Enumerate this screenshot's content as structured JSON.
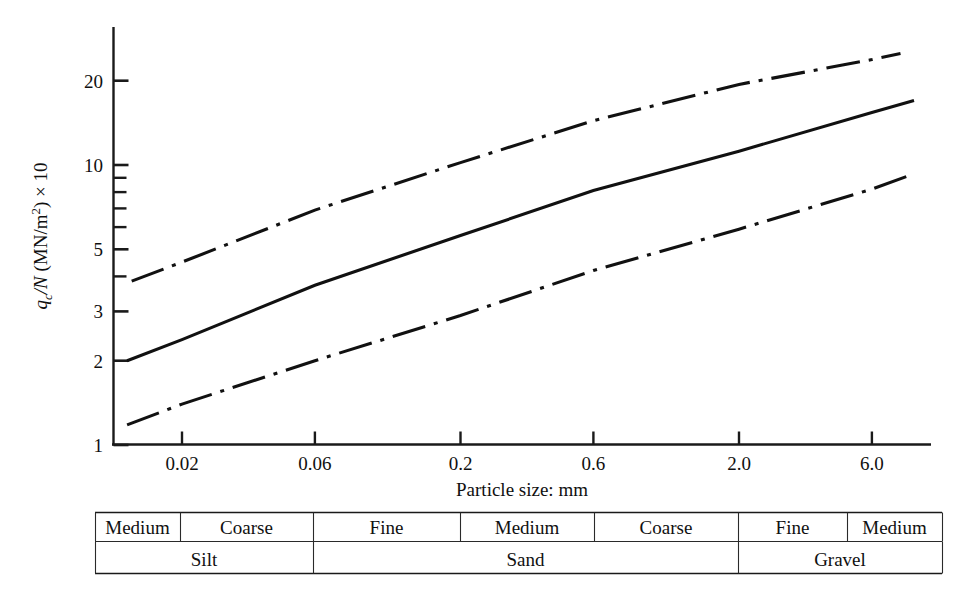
{
  "figure": {
    "background_color": "#ffffff",
    "ink_color": "#111111"
  },
  "axes": {
    "x_title": "Particle size: mm",
    "y_title_parts": {
      "q": "q",
      "sub_c": "c",
      "slash_n": "/N",
      "units": " (MN/m",
      "sup_2": "2",
      "tail": ") × 10"
    },
    "y_title_plain": "qc/N (MN/m2) × 10",
    "x_ticks": [
      "0.02",
      "0.06",
      "0.2",
      "0.6",
      "2.0",
      "6.0"
    ],
    "y_ticks_major": [
      "1",
      "2",
      "3",
      "5",
      "10",
      "20"
    ],
    "y_ticks_minor": [
      "4",
      "6",
      "7",
      "8",
      "9"
    ]
  },
  "chart_data": {
    "type": "line",
    "title": "",
    "xlabel": "Particle size: mm",
    "ylabel": "qc/N (MN/m2) × 10",
    "xscale": "log",
    "yscale": "log",
    "xlim": [
      0.0113,
      8.6
    ],
    "ylim": [
      1,
      27
    ],
    "xticks": [
      0.02,
      0.06,
      0.2,
      0.6,
      2.0,
      6.0
    ],
    "xticklabels": [
      "0.02",
      "0.06",
      "0.2",
      "0.6",
      "2.0",
      "6.0"
    ],
    "yticks": [
      1,
      2,
      3,
      4,
      5,
      6,
      7,
      8,
      9,
      10,
      20
    ],
    "yticklabels_shown": [
      "1",
      "2",
      "3",
      "5",
      "10",
      "20"
    ],
    "grid": false,
    "legend": null,
    "series": [
      {
        "name": "upper bound",
        "style": "dash-dot",
        "x": [
          0.0132,
          7.6
        ],
        "y": [
          3.85,
          25.0
        ],
        "points": [
          {
            "x": 0.0132,
            "y": 3.85
          },
          {
            "x": 0.02,
            "y": 4.5
          },
          {
            "x": 0.06,
            "y": 6.9
          },
          {
            "x": 0.2,
            "y": 10.2
          },
          {
            "x": 0.6,
            "y": 14.4
          },
          {
            "x": 2.0,
            "y": 19.4
          },
          {
            "x": 6.0,
            "y": 23.8
          },
          {
            "x": 7.6,
            "y": 25.0
          }
        ]
      },
      {
        "name": "mean",
        "style": "solid",
        "x": [
          0.0127,
          8.5
        ],
        "y": [
          2.0,
          17.0
        ],
        "points": [
          {
            "x": 0.0127,
            "y": 2.0
          },
          {
            "x": 0.02,
            "y": 2.38
          },
          {
            "x": 0.06,
            "y": 3.72
          },
          {
            "x": 0.2,
            "y": 5.6
          },
          {
            "x": 0.6,
            "y": 8.1
          },
          {
            "x": 2.0,
            "y": 11.2
          },
          {
            "x": 6.0,
            "y": 15.4
          },
          {
            "x": 8.5,
            "y": 17.0
          }
        ]
      },
      {
        "name": "lower bound",
        "style": "dash-dot",
        "x": [
          0.0127,
          8.5
        ],
        "y": [
          1.18,
          9.3
        ],
        "points": [
          {
            "x": 0.0127,
            "y": 1.18
          },
          {
            "x": 0.02,
            "y": 1.4
          },
          {
            "x": 0.06,
            "y": 2.0
          },
          {
            "x": 0.2,
            "y": 2.9
          },
          {
            "x": 0.6,
            "y": 4.2
          },
          {
            "x": 2.0,
            "y": 5.9
          },
          {
            "x": 6.0,
            "y": 8.2
          },
          {
            "x": 8.5,
            "y": 9.3
          }
        ]
      }
    ]
  },
  "classification_table": {
    "row_fractions": {
      "note": "boundaries as chart x pixel positions of vertical dividers"
    },
    "subdivisions": [
      {
        "label": "Medium",
        "x0": 95,
        "x1": 180
      },
      {
        "label": "Coarse",
        "x0": 180,
        "x1": 313
      },
      {
        "label": "Fine",
        "x0": 313,
        "x1": 460
      },
      {
        "label": "Medium",
        "x0": 460,
        "x1": 594
      },
      {
        "label": "Coarse",
        "x0": 594,
        "x1": 738
      },
      {
        "label": "Fine",
        "x0": 738,
        "x1": 847
      },
      {
        "label": "Medium",
        "x0": 847,
        "x1": 942
      }
    ],
    "soil_types": [
      {
        "label": "Silt",
        "x0": 95,
        "x1": 313
      },
      {
        "label": "Sand",
        "x0": 313,
        "x1": 738
      },
      {
        "label": "Gravel",
        "x0": 738,
        "x1": 942
      }
    ]
  }
}
